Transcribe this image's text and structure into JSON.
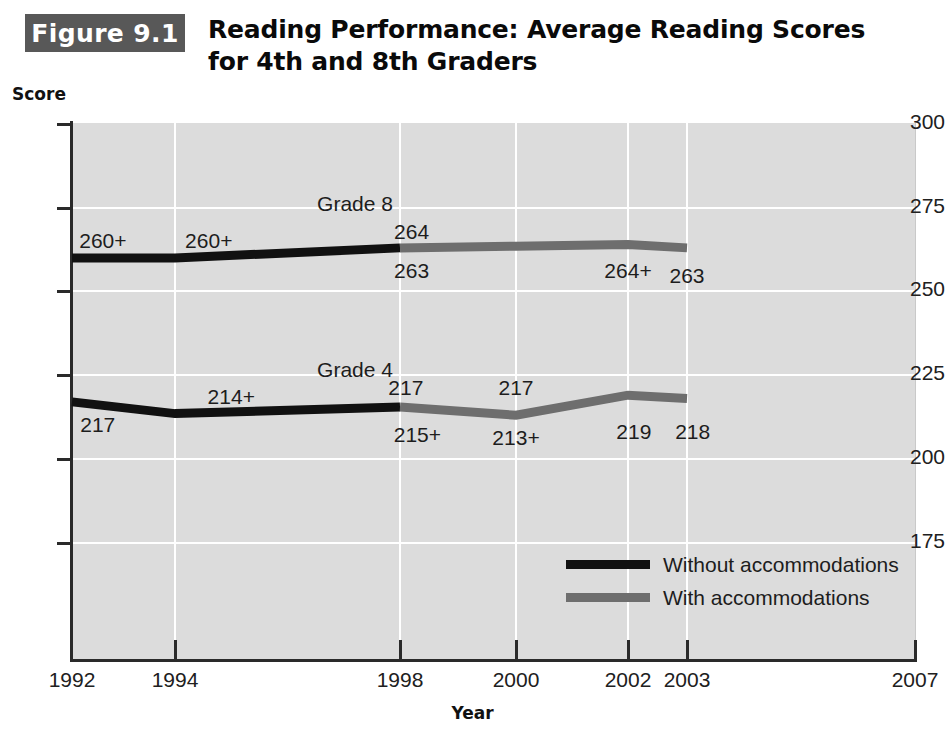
{
  "figure": {
    "badge": "Figure 9.1",
    "title_line1": "Reading Performance: Average Reading Scores",
    "title_line2": "for 4th and 8th Graders",
    "badge_bg": "#585858",
    "badge_fg": "#ffffff"
  },
  "axes": {
    "y_title": "Score",
    "x_title": "Year"
  },
  "chart_data": {
    "type": "line",
    "title": "Reading Performance: Average Reading Scores for 4th and 8th Graders",
    "xlabel": "Year",
    "ylabel": "Score",
    "xlim": [
      1992,
      2007
    ],
    "ylim": [
      160,
      300
    ],
    "yticks": [
      300,
      275,
      250,
      225,
      200,
      175
    ],
    "ytick_labels": [
      "300",
      "275",
      "250",
      "225",
      "200",
      "175"
    ],
    "xticks": [
      1992,
      1994,
      1998,
      2000,
      2002,
      2003,
      2007
    ],
    "xtick_labels": [
      "1992",
      "1994",
      "1998",
      "2000",
      "2002",
      "2003",
      "2007"
    ],
    "grid": true,
    "legend_position": "inside-lower-right",
    "colors": {
      "without_accommodations": "#111111",
      "with_accommodations": "#6e6e6e",
      "plot_background": "#dcdcdc",
      "gridline": "#ffffff",
      "axis": "#2a2a2a"
    },
    "legend": [
      {
        "name": "Without accommodations",
        "color": "#111111"
      },
      {
        "name": "With accommodations",
        "color": "#6e6e6e"
      }
    ],
    "series": [
      {
        "name": "Grade 8 — Without accommodations",
        "group": "Grade 8",
        "accommodations": false,
        "color": "#111111",
        "x": [
          1992,
          1994,
          1998
        ],
        "y": [
          260,
          260,
          263
        ]
      },
      {
        "name": "Grade 8 — With accommodations",
        "group": "Grade 8",
        "accommodations": true,
        "color": "#6e6e6e",
        "x": [
          1998,
          2000,
          2002,
          2003
        ],
        "y": [
          263,
          263.5,
          264,
          263
        ]
      },
      {
        "name": "Grade 4 — Without accommodations",
        "group": "Grade 4",
        "accommodations": false,
        "color": "#111111",
        "x": [
          1992,
          1994,
          1998
        ],
        "y": [
          217,
          213.5,
          215.5
        ]
      },
      {
        "name": "Grade 4 — With accommodations",
        "group": "Grade 4",
        "accommodations": true,
        "color": "#6e6e6e",
        "x": [
          1998,
          2000,
          2002,
          2003
        ],
        "y": [
          215.5,
          213,
          219,
          218
        ]
      }
    ],
    "series_labels": [
      {
        "text": "Grade 8",
        "x": 1997.2,
        "y": 275.5
      },
      {
        "text": "Grade 4",
        "x": 1997.2,
        "y": 225.8
      }
    ],
    "annotations": [
      {
        "text": "260+",
        "x": 1992.6,
        "y": 264.5,
        "series": "Grade 8",
        "position": "above"
      },
      {
        "text": "260+",
        "x": 1994.6,
        "y": 264.5,
        "series": "Grade 8",
        "position": "above"
      },
      {
        "text": "264",
        "x": 1998.2,
        "y": 267.0,
        "series": "Grade 8",
        "position": "above"
      },
      {
        "text": "263",
        "x": 1998.2,
        "y": 255.5,
        "series": "Grade 8",
        "position": "below"
      },
      {
        "text": "264+",
        "x": 2002.0,
        "y": 255.5,
        "series": "Grade 8",
        "position": "below"
      },
      {
        "text": "263",
        "x": 2003.0,
        "y": 254.0,
        "series": "Grade 8",
        "position": "below"
      },
      {
        "text": "217",
        "x": 1992.5,
        "y": 209.5,
        "series": "Grade 4",
        "position": "below"
      },
      {
        "text": "214+",
        "x": 1995.0,
        "y": 218.0,
        "series": "Grade 4",
        "position": "above"
      },
      {
        "text": "217",
        "x": 1998.1,
        "y": 220.5,
        "series": "Grade 4",
        "position": "above"
      },
      {
        "text": "215+",
        "x": 1998.3,
        "y": 206.5,
        "series": "Grade 4",
        "position": "below"
      },
      {
        "text": "217",
        "x": 2000.0,
        "y": 220.5,
        "series": "Grade 4",
        "position": "above"
      },
      {
        "text": "213+",
        "x": 2000.0,
        "y": 205.5,
        "series": "Grade 4",
        "position": "below"
      },
      {
        "text": "219",
        "x": 2002.1,
        "y": 207.5,
        "series": "Grade 4",
        "position": "below"
      },
      {
        "text": "218",
        "x": 2003.1,
        "y": 207.5,
        "series": "Grade 4",
        "position": "below"
      }
    ]
  }
}
